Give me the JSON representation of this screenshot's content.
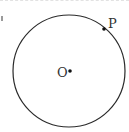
{
  "diagram": {
    "type": "circle-with-points",
    "circle": {
      "cx": 69,
      "cy": 71,
      "r": 56,
      "stroke": "#2a2a2a"
    },
    "points": [
      {
        "name": "O",
        "label": "O",
        "x": 70,
        "y": 71,
        "label_x": 57,
        "label_y": 77
      },
      {
        "name": "P",
        "label": "P",
        "x": 104,
        "y": 29,
        "label_x": 108,
        "label_y": 28
      }
    ]
  }
}
